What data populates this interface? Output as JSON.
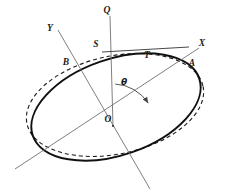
{
  "figure": {
    "kind": "geometry-diagram",
    "width": 232,
    "height": 192,
    "background": "#ffffff",
    "stroke_dark": "#1a1a1a",
    "stroke_thin": "#6e6e6e"
  },
  "labels": {
    "axis_x": "X",
    "axis_y": "Y",
    "point_q": "Q",
    "point_a": "A",
    "point_b": "B",
    "point_s": "S",
    "point_t": "T",
    "origin": "O",
    "angle": "θ"
  },
  "label_positions": {
    "axis_x": {
      "x": 202,
      "y": 46
    },
    "axis_y": {
      "x": 50,
      "y": 31
    },
    "point_q": {
      "x": 107,
      "y": 13
    },
    "point_a": {
      "x": 192,
      "y": 66
    },
    "point_b": {
      "x": 66,
      "y": 65
    },
    "point_s": {
      "x": 96,
      "y": 47
    },
    "point_t": {
      "x": 147,
      "y": 58
    },
    "origin": {
      "x": 108,
      "y": 122
    },
    "angle": {
      "x": 124,
      "y": 85
    }
  },
  "geometry": {
    "ellipse_solid": {
      "cx": 116,
      "cy": 107,
      "rx": 88,
      "ry": 48,
      "rotation_deg": -19,
      "stroke_width": 2.0,
      "dash": "none"
    },
    "ellipse_dashed": {
      "cx": 115,
      "cy": 105,
      "rx": 90,
      "ry": 49,
      "rotation_deg": -12,
      "stroke_width": 1.1,
      "dash": "4,3"
    },
    "axis_x_line": {
      "x1": 15,
      "y1": 169,
      "x2": 199,
      "y2": 48
    },
    "axis_y_line": {
      "x1": 58,
      "y1": 30,
      "x2": 150,
      "y2": 189
    },
    "line_q": {
      "x1": 110,
      "y1": 16,
      "x2": 113,
      "y2": 126
    },
    "tangent_st": {
      "x1": 102,
      "y1": 52,
      "x2": 189,
      "y2": 47
    },
    "angle_arc": {
      "cx": 113,
      "cy": 126,
      "radius": 42,
      "start_deg": -87,
      "end_deg": -33
    }
  }
}
